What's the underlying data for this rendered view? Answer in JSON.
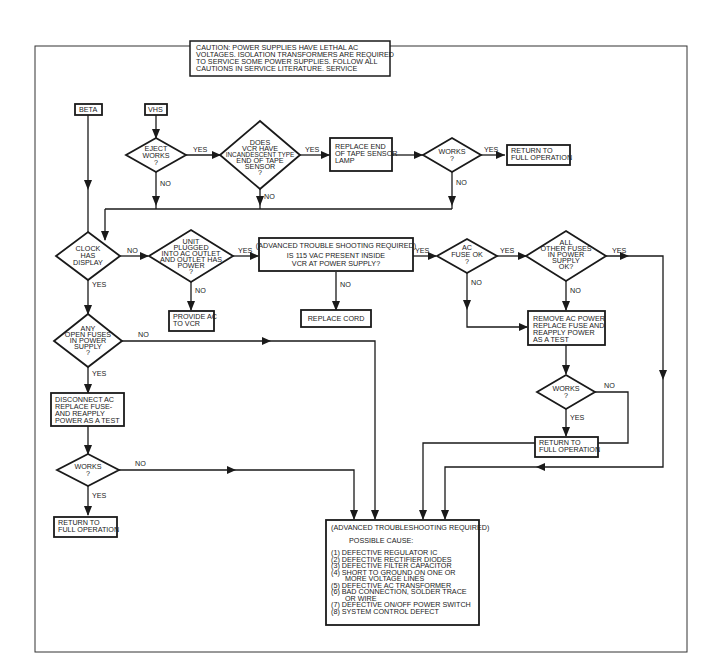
{
  "caution": {
    "lines": [
      "CAUTION: POWER SUPPLIES HAVE LETHAL AC",
      "VOLTAGES.  ISOLATION TRANSFORMERS ARE REQUIRED",
      "TO SERVICE SOME POWER SUPPLIES.  FOLLOW ALL",
      "CAUTIONS IN SERVICE LITERATURE.  SERVICE",
      "POWER SUPPLIES AT YOUR OWN RISK."
    ]
  },
  "starts": {
    "beta": "BETA",
    "vhs": "VHS"
  },
  "nodes": {
    "eject_works": [
      "EJECT",
      "WORKS",
      "?"
    ],
    "incandescent": [
      "DOES",
      "VCR HAVE",
      "INCANDESCENT TYPE",
      "END OF TAPE",
      "SENSOR",
      "?"
    ],
    "replace_lamp": [
      "REPLACE END",
      "OF TAPE SENSOR",
      "LAMP"
    ],
    "works_top": [
      "WORKS",
      "?"
    ],
    "return_top": [
      "RETURN TO",
      "FULL OPERATION"
    ],
    "clock_display": [
      "CLOCK",
      "HAS",
      "DISPLAY"
    ],
    "unit_plugged": [
      "UNIT",
      "PLUGGED",
      "INTO AC OUTLET",
      "AND OUTLET HAS",
      "POWER",
      "?"
    ],
    "provide_ac": [
      "PROVIDE AC",
      "TO VCR"
    ],
    "vac_present": [
      "(ADVANCED TROUBLE SHOOTING REQUIRED)",
      "IS 115 VAC PRESENT  INSIDE",
      "VCR AT POWER SUPPLY?"
    ],
    "replace_cord": [
      "REPLACE CORD"
    ],
    "ac_fuse_ok": [
      "AC",
      "FUSE OK",
      "?"
    ],
    "other_fuses": [
      "ALL",
      "OTHER FUSES",
      "IN POWER",
      "SUPPLY",
      "OK?"
    ],
    "remove_ac": [
      "REMOVE AC POWER",
      "REPLACE FUSE AND",
      "REAPPLY POWER",
      "AS A TEST"
    ],
    "works_right": [
      "WORKS",
      "?"
    ],
    "return_right": [
      "RETURN TO",
      "FULL OPERATION"
    ],
    "open_fuses": [
      "ANY",
      "OPEN FUSES",
      "IN POWER",
      "SUPPLY",
      "?"
    ],
    "disconnect_ac": [
      "DISCONNECT AC",
      "REPLACE FUSE-",
      "AND REAPPLY",
      "POWER AS A TEST"
    ],
    "works_left": [
      "WORKS",
      "?"
    ],
    "return_left": [
      "RETURN TO",
      "FULL OPERATION"
    ]
  },
  "final_box": {
    "header": "(ADVANCED TROUBLESHOOTING REQUIRED)",
    "subheader": "POSSIBLE CAUSE:",
    "causes": [
      "(1)  DEFECTIVE REGULATOR IC",
      "(2)  DEFECTIVE RECTIFIER DIODES",
      "(3)  DEFECTIVE FILTER CAPACITOR",
      "(4)  SHORT TO GROUND ON ONE OR",
      "       MORE VOLTAGE LINES",
      "(5)  DEFECTIVE AC TRANSFORMER",
      "(6)  BAD CONNECTION, SOLDER TRACE",
      "       OR WIRE",
      "(7)  DEFECTIVE ON/OFF POWER SWITCH",
      "(8)  SYSTEM CONTROL DEFECT"
    ]
  },
  "labels": {
    "yes": "YES",
    "no": "NO"
  }
}
